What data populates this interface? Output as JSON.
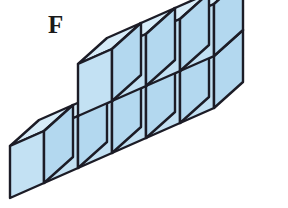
{
  "figure": {
    "label": "F",
    "kind": "isometric-cube-stack"
  },
  "colors": {
    "background": "#ffffff",
    "top_face": "#d7ecf8",
    "front_face": "#c3e1f3",
    "side_face": "#b3d8ef",
    "edge": "#1c1c26",
    "label_text": "#1a1a1a"
  },
  "geometry": {
    "cube_width": 34,
    "cube_height": 52,
    "depth_x": 29,
    "depth_y": -26,
    "origin_x": 10,
    "origin_y": 198,
    "stroke_width": 2.4
  },
  "structure": {
    "bottom_row_count": 6,
    "top_row_count": 4,
    "top_row_start_index": 2,
    "total_cubes": 10,
    "cells": [
      {
        "col": 0,
        "level": 0
      },
      {
        "col": 1,
        "level": 0
      },
      {
        "col": 2,
        "level": 0
      },
      {
        "col": 3,
        "level": 0
      },
      {
        "col": 4,
        "level": 0
      },
      {
        "col": 5,
        "level": 0
      },
      {
        "col": 2,
        "level": 1
      },
      {
        "col": 3,
        "level": 1
      },
      {
        "col": 4,
        "level": 1
      },
      {
        "col": 5,
        "level": 1
      }
    ]
  }
}
